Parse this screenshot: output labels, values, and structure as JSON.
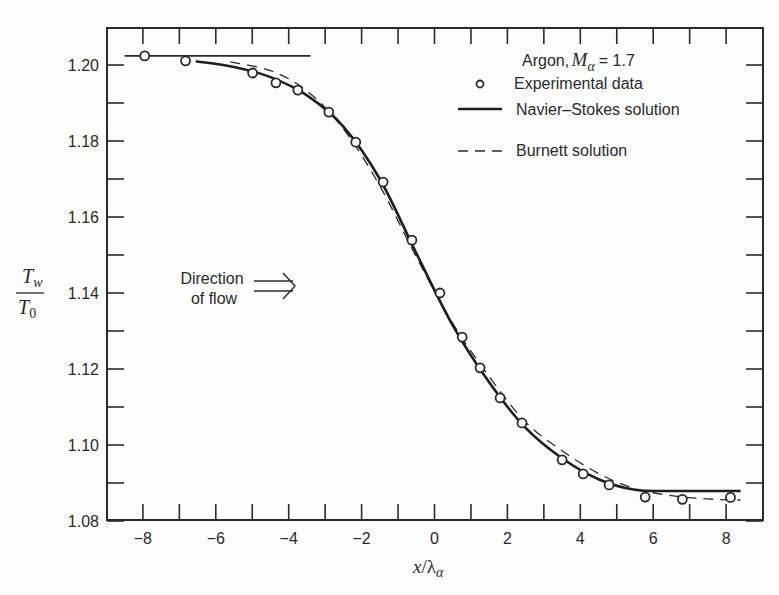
{
  "chart_data": {
    "type": "line",
    "title": "",
    "xlabel": "x/λα",
    "ylabel": "Tw/T0",
    "xlim": [
      -8.6,
      8.8
    ],
    "ylim": [
      1.08,
      1.2075
    ],
    "x_ticks": [
      -8,
      -6,
      -4,
      -2,
      0,
      2,
      4,
      6,
      8
    ],
    "x_tick_labels": [
      "−8",
      "−6",
      "−4",
      "−2",
      "0",
      "2",
      "4",
      "6",
      "8"
    ],
    "x_minor_step": 1,
    "y_ticks": [
      1.08,
      1.1,
      1.12,
      1.14,
      1.16,
      1.18,
      1.2
    ],
    "y_tick_labels": [
      "1.08",
      "1.10",
      "1.12",
      "1.14",
      "1.16",
      "1.18",
      "1.20"
    ],
    "y_minor_step": 0.01,
    "grid": false,
    "legend_position": "upper right",
    "legend": {
      "title": "Argon, M_α = 1.7",
      "title_prefix": "Argon,",
      "title_symbol": "M",
      "title_subscript": "α",
      "title_suffix": "= 1.7",
      "entries": [
        {
          "marker": "open-circle",
          "label": "Experimental data"
        },
        {
          "marker": "solid-line",
          "label": "Navier–Stokes solution"
        },
        {
          "marker": "dashed-line",
          "label": "Burnett solution"
        }
      ]
    },
    "annotations": [
      {
        "text_line1": "Direction",
        "text_line2": "of flow",
        "arrow": "double-right-arrow",
        "x": -5.5,
        "y": 1.142
      },
      {
        "type": "reference-line",
        "description": "upstream wall temperature level",
        "y": 1.2024,
        "x_from": -8.5,
        "x_to": -3.4
      }
    ],
    "series": [
      {
        "name": "Experimental data",
        "style": "markers",
        "x": [
          -7.95,
          -6.83,
          -4.99,
          -4.35,
          -3.75,
          -2.9,
          -2.16,
          -1.41,
          -0.62,
          0.15,
          0.76,
          1.25,
          1.8,
          2.4,
          3.5,
          4.08,
          4.79,
          5.78,
          6.8,
          8.12
        ],
        "y": [
          1.2024,
          1.2011,
          1.1979,
          1.1953,
          1.1934,
          1.1876,
          1.1797,
          1.1692,
          1.1539,
          1.14,
          1.1284,
          1.1203,
          1.1124,
          1.1058,
          1.0961,
          1.0924,
          1.0895,
          1.0863,
          1.0857,
          1.0862
        ]
      },
      {
        "name": "Navier–Stokes solution",
        "style": "solid",
        "x": [
          -6.55,
          -5.5,
          -4.5,
          -3.5,
          -2.5,
          -1.5,
          -0.5,
          0.5,
          1.5,
          2.5,
          3.5,
          4.5,
          5.5,
          6.5,
          7.5,
          8.4
        ],
        "y": [
          1.201,
          1.1995,
          1.1968,
          1.192,
          1.1838,
          1.17,
          1.1505,
          1.1315,
          1.1165,
          1.1045,
          1.0965,
          1.091,
          1.0882,
          1.0879,
          1.0879,
          1.0879
        ]
      },
      {
        "name": "Burnett solution",
        "style": "dashed",
        "x": [
          -5.6,
          -4.5,
          -3.5,
          -2.5,
          -1.5,
          -0.5,
          0.5,
          1.5,
          2.5,
          3.5,
          4.5,
          5.5,
          6.5,
          7.5,
          8.4
        ],
        "y": [
          1.2008,
          1.1985,
          1.1932,
          1.1832,
          1.1682,
          1.1495,
          1.132,
          1.118,
          1.106,
          1.0985,
          1.0925,
          1.0885,
          1.0867,
          1.0858,
          1.0855
        ]
      }
    ]
  },
  "axis": {
    "ylabel_numerator": "T",
    "ylabel_numerator_sub": "w",
    "ylabel_denominator": "T",
    "ylabel_denominator_sub": "0",
    "xlabel_x": "x",
    "xlabel_slash": "/λ",
    "xlabel_sub": "α"
  },
  "colors": {
    "ink": "#2a2a2a",
    "background": "#fdfdfd"
  }
}
